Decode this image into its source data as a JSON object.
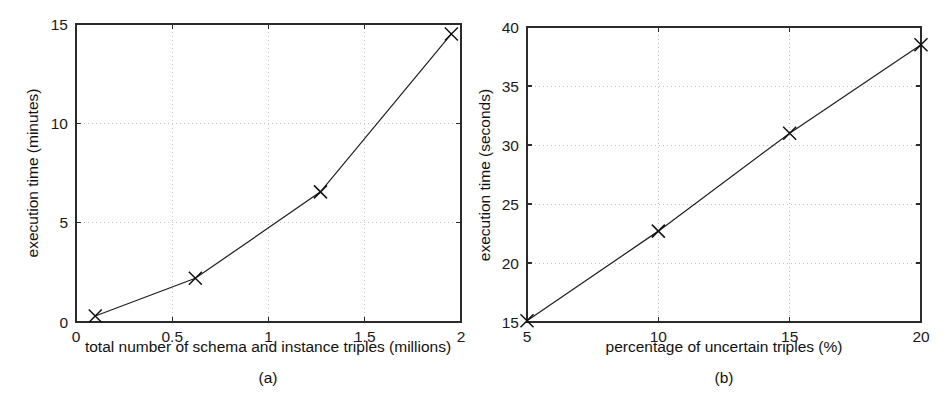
{
  "figure": {
    "background_color": "#ffffff",
    "line_color": "#212121",
    "grid_color": "#bdbdbd",
    "axis_color": "#2b2b2b",
    "panel_count": 2
  },
  "chart_data": [
    {
      "type": "line",
      "panel_label": "(a)",
      "title": "",
      "xlabel": "total number of schema and instance triples (millions)",
      "ylabel": "execution time (minutes)",
      "xlim": [
        0,
        2
      ],
      "ylim": [
        0,
        15
      ],
      "xticks": [
        0,
        0.5,
        1,
        1.5,
        2
      ],
      "xticklabels": [
        "0",
        "0.5",
        "1",
        "1.5",
        "2"
      ],
      "yticks": [
        0,
        5,
        10,
        15
      ],
      "yticklabels": [
        "0",
        "5",
        "10",
        "15"
      ],
      "grid": true,
      "legend": "none",
      "marker": "x",
      "x": [
        0.1,
        0.62,
        1.27,
        1.95
      ],
      "y": [
        0.3,
        2.2,
        6.55,
        14.5
      ]
    },
    {
      "type": "line",
      "panel_label": "(b)",
      "title": "",
      "xlabel": "percentage of uncertain triples (%)",
      "ylabel": "execution time (seconds)",
      "xlim": [
        5,
        20
      ],
      "ylim": [
        15,
        40
      ],
      "xticks": [
        5,
        10,
        15,
        20
      ],
      "xticklabels": [
        "5",
        "10",
        "15",
        "20"
      ],
      "yticks": [
        15,
        20,
        25,
        30,
        35,
        40
      ],
      "yticklabels": [
        "15",
        "20",
        "25",
        "30",
        "35",
        "40"
      ],
      "grid": true,
      "legend": "none",
      "marker": "x",
      "x": [
        5,
        10,
        15,
        20
      ],
      "y": [
        15.1,
        22.7,
        31.0,
        38.5
      ]
    }
  ]
}
